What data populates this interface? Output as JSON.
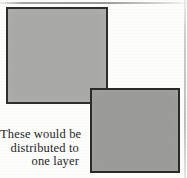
{
  "figure": {
    "name": "overlapping-layer-squares-diagram",
    "background_color": "#fdfdfc",
    "caption": {
      "alignment": "right",
      "lines": [
        "These would be",
        "distributed to",
        "one layer"
      ],
      "full_text": "These would be distributed to one layer",
      "text_color": "#26241f"
    },
    "shapes": [
      {
        "id": "square-back",
        "label": "upper-left square",
        "fill_color": "#a9a9a8",
        "border_color": "#2f2e2c",
        "x": 6,
        "y": 7,
        "width": 102,
        "height": 97
      },
      {
        "id": "square-front",
        "label": "lower-right square",
        "fill_color": "#9b9b9a",
        "border_color": "#2b2a28",
        "x": 90,
        "y": 88,
        "width": 90,
        "height": 85
      }
    ],
    "artifacts": [
      {
        "id": "scan-line-top",
        "label": "scan edge line top",
        "color": "#969696"
      },
      {
        "id": "scan-line-right",
        "label": "scan edge line right",
        "color": "#a5a5a5"
      }
    ]
  }
}
